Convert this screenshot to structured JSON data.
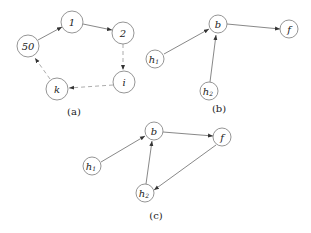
{
  "diagrams": {
    "a": {
      "caption": "(a)",
      "nodes": [
        {
          "id": "n50",
          "label": "50",
          "x": 28,
          "y": 46
        },
        {
          "id": "n1",
          "label": "1",
          "x": 72,
          "y": 22
        },
        {
          "id": "n2",
          "label": "2",
          "x": 123,
          "y": 33
        },
        {
          "id": "ni",
          "label": "i",
          "x": 124,
          "y": 82
        },
        {
          "id": "nk",
          "label": "k",
          "x": 57,
          "y": 89
        }
      ],
      "edges": [
        {
          "from": "50",
          "to": "1",
          "style": "solid"
        },
        {
          "from": "1",
          "to": "2",
          "style": "solid"
        },
        {
          "from": "2",
          "to": "i",
          "style": "dashed"
        },
        {
          "from": "i",
          "to": "k",
          "style": "dashed"
        },
        {
          "from": "k",
          "to": "50",
          "style": "dashed"
        }
      ]
    },
    "b": {
      "caption": "(b)",
      "nodes": [
        {
          "id": "b",
          "label": "b",
          "x": 218,
          "y": 24
        },
        {
          "id": "f",
          "label": "f",
          "x": 289,
          "y": 29
        },
        {
          "id": "h1",
          "label": "h",
          "sub": "1",
          "x": 155,
          "y": 59
        },
        {
          "id": "h2",
          "label": "h",
          "sub": "2",
          "x": 209,
          "y": 91
        }
      ],
      "edges": [
        {
          "from": "h1",
          "to": "b",
          "style": "solid"
        },
        {
          "from": "h2",
          "to": "b",
          "style": "solid"
        },
        {
          "from": "b",
          "to": "f",
          "style": "solid"
        }
      ]
    },
    "c": {
      "caption": "(c)",
      "nodes": [
        {
          "id": "b",
          "label": "b",
          "x": 154,
          "y": 131
        },
        {
          "id": "f",
          "label": "f",
          "x": 222,
          "y": 137
        },
        {
          "id": "h1",
          "label": "h",
          "sub": "1",
          "x": 92,
          "y": 166
        },
        {
          "id": "h2",
          "label": "h",
          "sub": "2",
          "x": 145,
          "y": 193
        }
      ],
      "edges": [
        {
          "from": "h1",
          "to": "b",
          "style": "solid"
        },
        {
          "from": "h2",
          "to": "b",
          "style": "solid"
        },
        {
          "from": "b",
          "to": "f",
          "style": "solid"
        },
        {
          "from": "f",
          "to": "h2",
          "style": "solid"
        }
      ]
    }
  }
}
